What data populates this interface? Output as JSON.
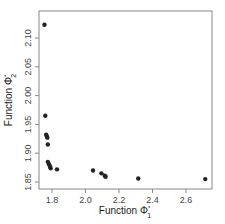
{
  "chart_data": {
    "type": "scatter",
    "title": "",
    "xlabel": "Function Φ1*",
    "ylabel": "Function Φ2*",
    "xlabel_parts": {
      "base": "Function Φ",
      "sub": "1",
      "sup": "*"
    },
    "ylabel_parts": {
      "base": "Function Φ",
      "sub": "2",
      "sup": "*"
    },
    "xlim": [
      1.72,
      2.76
    ],
    "ylim": [
      1.838,
      2.133
    ],
    "x_ticks": [
      1.8,
      2.0,
      2.2,
      2.4,
      2.6
    ],
    "x_tick_labels": [
      "1.8",
      "2.0",
      "2.2",
      "2.4",
      "2.6"
    ],
    "y_ticks": [
      1.85,
      1.9,
      1.95,
      2.0,
      2.05,
      2.1
    ],
    "y_tick_labels": [
      "1.85",
      "1.90",
      "1.95",
      "2.00",
      "2.05",
      "2.10"
    ],
    "grid": false,
    "legend": null,
    "marker_color": "#222222",
    "points": [
      {
        "x": 1.755,
        "y": 2.123
      },
      {
        "x": 1.76,
        "y": 1.965
      },
      {
        "x": 1.765,
        "y": 1.932
      },
      {
        "x": 1.77,
        "y": 1.929
      },
      {
        "x": 1.772,
        "y": 1.927
      },
      {
        "x": 1.775,
        "y": 1.915
      },
      {
        "x": 1.775,
        "y": 1.885
      },
      {
        "x": 1.782,
        "y": 1.881
      },
      {
        "x": 1.788,
        "y": 1.877
      },
      {
        "x": 1.792,
        "y": 1.874
      },
      {
        "x": 1.83,
        "y": 1.872
      },
      {
        "x": 2.045,
        "y": 1.87
      },
      {
        "x": 2.095,
        "y": 1.865
      },
      {
        "x": 2.115,
        "y": 1.861
      },
      {
        "x": 2.12,
        "y": 1.859
      },
      {
        "x": 2.315,
        "y": 1.856
      },
      {
        "x": 2.715,
        "y": 1.855
      }
    ]
  }
}
